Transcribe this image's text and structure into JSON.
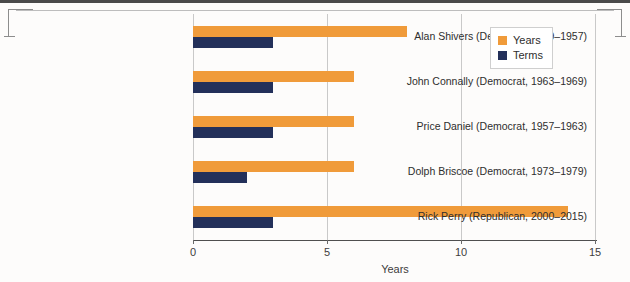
{
  "chart_data": {
    "type": "bar",
    "orientation": "horizontal",
    "title": "",
    "xlabel": "Years",
    "ylabel": "",
    "xlim": [
      0,
      15
    ],
    "xticks": [
      "0",
      "5",
      "10",
      "15"
    ],
    "grid": true,
    "legend_position": "top-right",
    "categories": [
      "Alan Shivers (Democrat, 1949–1957)",
      "John Connally (Democrat, 1963–1969)",
      "Price Daniel (Democrat, 1957–1963)",
      "Dolph Briscoe (Democrat, 1973–1979)",
      "Rick Perry (Republican, 2000–2015)"
    ],
    "series": [
      {
        "name": "Years",
        "color": "#F09B3A",
        "values": [
          8,
          6,
          6,
          6,
          14
        ]
      },
      {
        "name": "Terms",
        "color": "#23305A",
        "values": [
          3,
          3,
          3,
          2,
          3
        ]
      }
    ]
  },
  "legend": {
    "items": [
      {
        "label": "Years",
        "color": "#F09B3A"
      },
      {
        "label": "Terms",
        "color": "#23305A"
      }
    ]
  },
  "axis": {
    "x_title": "Years",
    "ticks": [
      {
        "label": "0",
        "value": 0
      },
      {
        "label": "5",
        "value": 5
      },
      {
        "label": "10",
        "value": 10
      },
      {
        "label": "15",
        "value": 15
      }
    ]
  }
}
